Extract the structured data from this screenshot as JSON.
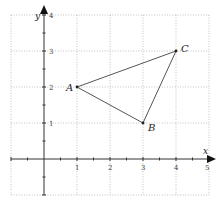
{
  "figure": {
    "type": "coordinate-plane-triangle",
    "axes": {
      "x_label": "x",
      "y_label": "y",
      "x_range": [
        -1,
        5
      ],
      "y_range": [
        -1,
        4
      ],
      "x_ticks": [
        "1",
        "2",
        "3",
        "4",
        "5"
      ],
      "y_ticks": [
        "1",
        "2",
        "3",
        "4"
      ],
      "grid": "dotted, unit spacing",
      "minor_ticks": "every 0.5 unit"
    },
    "points": [
      {
        "name": "A",
        "x": 1,
        "y": 2
      },
      {
        "name": "B",
        "x": 3,
        "y": 1
      },
      {
        "name": "C",
        "x": 4,
        "y": 3
      }
    ],
    "segments": [
      [
        "A",
        "B"
      ],
      [
        "B",
        "C"
      ],
      [
        "C",
        "A"
      ]
    ],
    "colors": {
      "grid": "#9a9a9a",
      "axis": "#333333",
      "triangle": "#555555"
    }
  }
}
